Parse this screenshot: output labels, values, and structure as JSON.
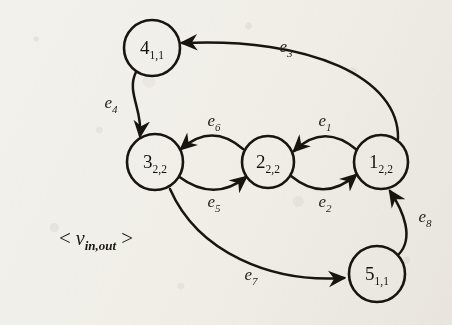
{
  "figure": {
    "type": "directed-graph",
    "background_color": "#f3f1ec",
    "ink_color": "#181511",
    "legend": {
      "open_bracket": "<",
      "variable": "v",
      "subscript": "in,out",
      "close_bracket": ">"
    },
    "nodes": [
      {
        "id": "n4",
        "label": "4",
        "subscript": "1,1",
        "cx": 152,
        "cy": 48,
        "r": 28
      },
      {
        "id": "n3",
        "label": "3",
        "subscript": "2,2",
        "cx": 155,
        "cy": 162,
        "r": 28
      },
      {
        "id": "n2",
        "label": "2",
        "subscript": "2,2",
        "cx": 268,
        "cy": 162,
        "r": 26
      },
      {
        "id": "n1",
        "label": "1",
        "subscript": "2,2",
        "cx": 381,
        "cy": 162,
        "r": 27
      },
      {
        "id": "n5",
        "label": "5",
        "subscript": "1,1",
        "cx": 377,
        "cy": 274,
        "r": 28
      }
    ],
    "edges": [
      {
        "id": "e1",
        "label": "e",
        "subscript": "1",
        "from": "n1",
        "to": "n2",
        "lx": 325,
        "ly": 122
      },
      {
        "id": "e2",
        "label": "e",
        "subscript": "2",
        "from": "n2",
        "to": "n1",
        "lx": 325,
        "ly": 203
      },
      {
        "id": "e3",
        "label": "e",
        "subscript": "3",
        "from": "n1",
        "to": "n4",
        "lx": 286,
        "ly": 48
      },
      {
        "id": "e4",
        "label": "e",
        "subscript": "4",
        "from": "n4",
        "to": "n3",
        "lx": 111,
        "ly": 104
      },
      {
        "id": "e5",
        "label": "e",
        "subscript": "5",
        "from": "n3",
        "to": "n2",
        "lx": 214,
        "ly": 203
      },
      {
        "id": "e6",
        "label": "e",
        "subscript": "6",
        "from": "n2",
        "to": "n3",
        "lx": 214,
        "ly": 122
      },
      {
        "id": "e7",
        "label": "e",
        "subscript": "7",
        "from": "n3",
        "to": "n5",
        "lx": 251,
        "ly": 276
      },
      {
        "id": "e8",
        "label": "e",
        "subscript": "8",
        "from": "n5",
        "to": "n1",
        "lx": 425,
        "ly": 218
      }
    ]
  }
}
